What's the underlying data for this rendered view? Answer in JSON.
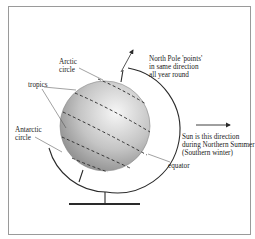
{
  "diagram": {
    "labels": {
      "arctic_circle": "Arctic\ncircle",
      "tropics": "tropics",
      "antarctic_circle": "Antarctic\ncircle",
      "north_pole": "North Pole 'points'\nin same direction\nall year round",
      "sun_direction": "Sun is this direction\nduring Northern Summer\n(Southern winter)",
      "equator": "equator"
    },
    "colors": {
      "line": "#2a2a2a",
      "globe_light": "#f4f4f4",
      "globe_dark": "#8c8c8c",
      "frame": "#9a9a9a"
    }
  }
}
